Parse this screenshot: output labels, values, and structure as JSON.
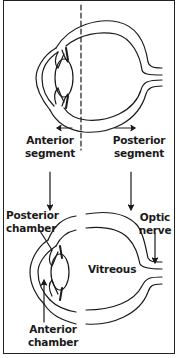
{
  "diagram": {
    "colors": {
      "stroke": "#1a1a1a",
      "background": "#ffffff"
    },
    "labels": {
      "anterior_segment": [
        "Anterior",
        "segment"
      ],
      "posterior_segment": [
        "Posterior",
        "segment"
      ],
      "posterior_chamber": [
        "Posterior",
        "chamber"
      ],
      "optic_nerve": [
        "Optic",
        "nerve"
      ],
      "vitreous": "Vitreous",
      "anterior_chamber": [
        "Anterior",
        "chamber"
      ]
    }
  }
}
